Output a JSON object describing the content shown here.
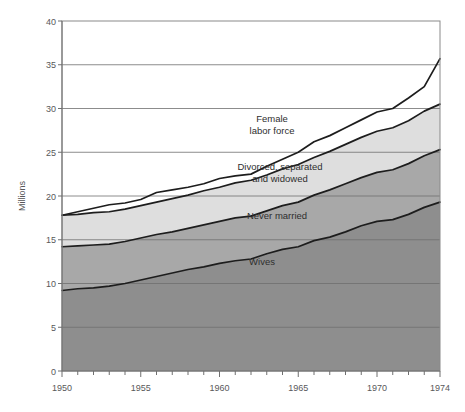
{
  "chart_data": {
    "type": "area",
    "title": "",
    "subtitle": "",
    "xlabel": "",
    "ylabel": "Millions",
    "stacked": true,
    "grid": true,
    "legend_position": "inline-labels",
    "xlim": [
      1950,
      1974
    ],
    "ylim": [
      0,
      40
    ],
    "yticks": [
      0,
      5,
      10,
      15,
      20,
      25,
      30,
      35,
      40
    ],
    "ytick_labels": [
      "0",
      "5",
      "10",
      "15",
      "20",
      "25",
      "30",
      "35",
      "40"
    ],
    "xticks": [
      1950,
      1955,
      1960,
      1965,
      1970,
      1974
    ],
    "xtick_labels": [
      "1950",
      "1955",
      "1960",
      "1965",
      "1970",
      "1974"
    ],
    "xtick_minor_step": 1,
    "x": [
      1950,
      1951,
      1952,
      1953,
      1954,
      1955,
      1956,
      1957,
      1958,
      1959,
      1960,
      1961,
      1962,
      1963,
      1964,
      1965,
      1966,
      1967,
      1968,
      1969,
      1970,
      1971,
      1972,
      1973,
      1974
    ],
    "series": [
      {
        "name": "Wives",
        "color": "#8e8e8e",
        "label_position": {
          "x": 1962.8,
          "y": 12.1
        },
        "values": [
          9.2,
          9.4,
          9.5,
          9.7,
          10.0,
          10.4,
          10.8,
          11.2,
          11.6,
          11.9,
          12.3,
          12.6,
          12.8,
          13.4,
          13.9,
          14.2,
          14.9,
          15.3,
          15.9,
          16.6,
          17.1,
          17.3,
          17.9,
          18.7,
          19.3
        ],
        "value_1950": 9.2,
        "value_1974": 19.3
      },
      {
        "name": "Never married",
        "color": "#a8a8a8",
        "label_position": {
          "x": 1961.7,
          "y": 16.6
        },
        "values": [
          5.0,
          4.9,
          4.9,
          4.8,
          4.8,
          4.8,
          4.8,
          4.7,
          4.7,
          4.8,
          4.8,
          4.9,
          4.9,
          4.9,
          5.0,
          5.1,
          5.2,
          5.4,
          5.5,
          5.5,
          5.6,
          5.7,
          5.8,
          5.9,
          6.0
        ],
        "cumulative_top": [
          14.2,
          14.3,
          14.4,
          14.5,
          14.8,
          15.2,
          15.6,
          15.9,
          16.3,
          16.7,
          17.1,
          17.5,
          17.7,
          18.3,
          18.9,
          19.3,
          20.1,
          20.7,
          21.4,
          22.1,
          22.7,
          23.0,
          23.7,
          24.6,
          25.3
        ],
        "top_1950": 14.2,
        "top_1974": 25.3
      },
      {
        "name": "Divorced, separated and widowed",
        "color": "#dedede",
        "label_position": {
          "x": 1963.6,
          "y": 22.5
        },
        "values": [
          3.6,
          3.6,
          3.7,
          3.7,
          3.7,
          3.7,
          3.7,
          3.8,
          3.8,
          3.9,
          3.9,
          4.0,
          4.1,
          4.1,
          4.2,
          4.3,
          4.3,
          4.4,
          4.5,
          4.6,
          4.7,
          4.8,
          4.9,
          5.1,
          5.2
        ],
        "cumulative_top": [
          17.8,
          17.9,
          18.1,
          18.2,
          18.5,
          18.9,
          19.3,
          19.7,
          20.1,
          20.6,
          21.0,
          21.5,
          21.8,
          22.4,
          23.1,
          23.6,
          24.4,
          25.1,
          25.9,
          26.7,
          27.4,
          27.8,
          28.6,
          29.7,
          30.5
        ],
        "top_1950": 17.8,
        "top_1974": 30.5
      },
      {
        "name": "Female labor force",
        "color": "#ffffff",
        "is_outer_total": true,
        "label_position": {
          "x": 1961.2,
          "y": 28.6
        },
        "cumulative_top": [
          17.8,
          17.9,
          18.1,
          18.2,
          18.5,
          18.9,
          19.3,
          19.7,
          20.1,
          20.6,
          21.0,
          21.5,
          21.8,
          22.4,
          23.1,
          23.6,
          24.4,
          25.1,
          25.9,
          26.7,
          27.4,
          27.8,
          28.6,
          29.7,
          30.5
        ],
        "total_values": [
          17.8,
          17.9,
          18.1,
          18.2,
          18.5,
          18.9,
          19.3,
          19.7,
          20.1,
          20.6,
          21.0,
          21.5,
          21.8,
          22.4,
          23.1,
          23.6,
          24.4,
          25.1,
          25.9,
          26.7,
          27.4,
          27.8,
          28.6,
          29.7,
          30.5
        ],
        "outline_values": [
          17.8,
          17.9,
          18.1,
          18.2,
          18.5,
          18.9,
          19.3,
          19.7,
          20.1,
          20.6,
          21.0,
          21.5,
          21.8,
          22.4,
          23.1,
          23.6,
          24.4,
          25.1,
          25.9,
          26.7,
          27.4,
          27.8,
          28.6,
          29.7,
          30.5
        ]
      }
    ],
    "top_boundary": {
      "name": "Female labor force total",
      "values": [
        17.8,
        18.2,
        18.6,
        19.0,
        19.2,
        19.6,
        20.4,
        20.7,
        21.0,
        21.4,
        22.0,
        22.3,
        22.5,
        23.4,
        24.2,
        25.0,
        26.2,
        26.9,
        27.8,
        28.7,
        29.6,
        30.0,
        31.2,
        32.5,
        35.7
      ],
      "value_1950": 17.8,
      "value_1974": 35.7
    },
    "annotations": [
      {
        "text": "Female\nlabor force",
        "x": 1961.2,
        "y": 28.6
      },
      {
        "text": "Divorced, separated\nand widowed",
        "x": 1963.6,
        "y": 22.5
      },
      {
        "text": "Never married",
        "x": 1961.7,
        "y": 16.6
      },
      {
        "text": "Wives",
        "x": 1962.8,
        "y": 12.1
      }
    ]
  },
  "labels": {
    "y_axis_title": "Millions",
    "series_female_labor_force_line1": "Female",
    "series_female_labor_force_line2": "labor force",
    "series_divorced_line1": "Divorced, separated",
    "series_divorced_line2": "and widowed",
    "series_never_married": "Never married",
    "series_wives": "Wives"
  },
  "yticks": {
    "t0": "0",
    "t5": "5",
    "t10": "10",
    "t15": "15",
    "t20": "20",
    "t25": "25",
    "t30": "30",
    "t35": "35",
    "t40": "40"
  },
  "xticks": {
    "t1950": "1950",
    "t1955": "1955",
    "t1960": "1960",
    "t1965": "1965",
    "t1970": "1970",
    "t1974": "1974"
  },
  "colors": {
    "band_wives": "#8e8e8e",
    "band_never_married": "#a8a8a8",
    "band_divorced": "#dedede",
    "band_outside": "#ffffff",
    "curve_stroke": "#1d1d1d",
    "grid": "#6f6f6f",
    "text": "#58585a"
  }
}
